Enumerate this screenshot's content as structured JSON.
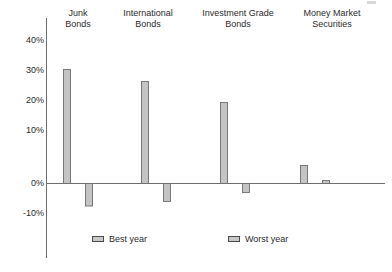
{
  "chart_data": {
    "type": "bar",
    "title": "",
    "subtitle": "",
    "xlabel": "",
    "ylabel": "",
    "ylim": [
      -14,
      44
    ],
    "grid": false,
    "legend_position": "bottom",
    "categories": [
      "Junk\nBonds",
      "International\nBonds",
      "Investment Grade\nBonds",
      "Money Market\nSecurities"
    ],
    "category_lines": [
      [
        "Junk",
        "Bonds"
      ],
      [
        "International",
        "Bonds"
      ],
      [
        "Investment Grade",
        "Bonds"
      ],
      [
        "Money Market",
        "Securities"
      ]
    ],
    "series": [
      {
        "name": "Best year",
        "values": [
          38,
          34,
          27,
          6
        ]
      },
      {
        "name": "Worst year",
        "values": [
          -7.5,
          -6,
          -3,
          1
        ]
      }
    ],
    "y_ticks": [
      {
        "value": 40,
        "label": "40%"
      },
      {
        "value": 30,
        "label": "30%"
      },
      {
        "value": 20,
        "label": "20%"
      },
      {
        "value": 10,
        "label": "10%"
      },
      {
        "value": 0,
        "label": "0%"
      },
      {
        "value": -10,
        "label": "-10%"
      }
    ],
    "colors": {
      "bar_fill": "#c4c4c4",
      "bar_edge": "#6e6e6e",
      "axis": "#6e6e6e",
      "text": "#2b2b2b",
      "background": "#ffffff"
    }
  },
  "legend": {
    "items": [
      {
        "label": "Best year"
      },
      {
        "label": "Worst year"
      }
    ]
  }
}
